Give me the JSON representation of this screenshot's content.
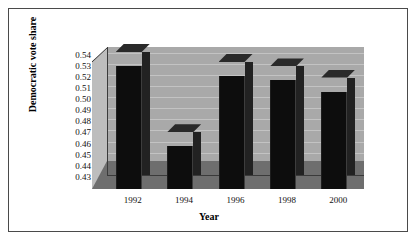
{
  "chart_data": {
    "type": "bar",
    "title": "",
    "xlabel": "Year",
    "ylabel": "Democratic vote share",
    "categories": [
      "1992",
      "1994",
      "1996",
      "1998",
      "2000"
    ],
    "values": [
      0.5405,
      0.4685,
      0.5315,
      0.5275,
      0.5175
    ],
    "ylim": [
      0.43,
      0.545
    ],
    "yticks": [
      "0.43",
      "0.44",
      "0.45",
      "0.46",
      "0.47",
      "0.48",
      "0.49",
      "0.50",
      "0.51",
      "0.52",
      "0.53",
      "0.54"
    ],
    "ytick_values": [
      0.43,
      0.44,
      0.45,
      0.46,
      0.47,
      0.48,
      0.49,
      0.5,
      0.51,
      0.52,
      0.53,
      0.54
    ],
    "grid": true,
    "legend": "none",
    "style": "3d-column",
    "colors": {
      "bar": "#0d0d0d",
      "bar_side": "#222222",
      "bar_top": "#2a2a2a",
      "plot_background": "#a9a9a9",
      "gridline": "#c3c3c3",
      "floor": "#6e6e6e",
      "side_wall": "#bdbdbd",
      "axis": "#3a3a3a",
      "border": "#4a4a4a",
      "page_background": "#ffffff",
      "text": "#111111"
    }
  }
}
